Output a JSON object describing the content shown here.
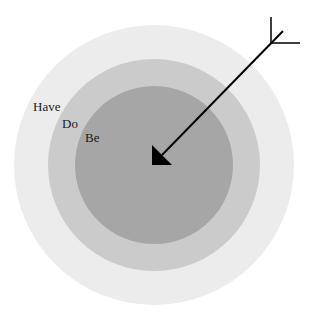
{
  "diagram": {
    "type": "concentric-target",
    "rings": [
      {
        "name": "outer",
        "label": "Have",
        "color": "#ececec",
        "cx": 154,
        "cy": 165,
        "r": 140
      },
      {
        "name": "middle",
        "label": "Do",
        "color": "#cbcbcb",
        "cx": 154,
        "cy": 165,
        "r": 106
      },
      {
        "name": "inner",
        "label": "Be",
        "color": "#a6a6a6",
        "cx": 154,
        "cy": 165,
        "r": 79
      }
    ],
    "labels": {
      "have": "Have",
      "do": "Do",
      "be": "Be"
    },
    "arrow": {
      "color": "#000000",
      "direction": "pointing to center from upper-right"
    }
  }
}
